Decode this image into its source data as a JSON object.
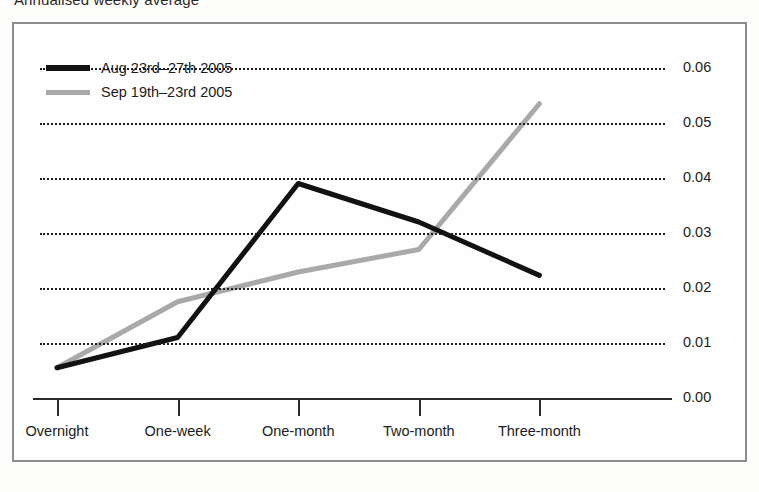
{
  "chart_data": {
    "type": "line",
    "title": "Annualised weekly average",
    "xlabel": "",
    "ylabel": "",
    "categories": [
      "Overnight",
      "One-week",
      "One-month",
      "Two-month",
      "Three-month"
    ],
    "series": [
      {
        "name": "Aug 23rd–27th 2005",
        "color": "#121212",
        "values": [
          0.0055,
          0.011,
          0.039,
          0.032,
          0.0223
        ]
      },
      {
        "name": "Sep 19th–23rd 2005",
        "color": "#a9a9a9",
        "values": [
          0.0055,
          0.0175,
          0.0229,
          0.027,
          0.0535
        ]
      }
    ],
    "ylim": [
      0.0,
      0.06
    ],
    "ytick_labels": [
      "0.00",
      "0.01",
      "0.02",
      "0.03",
      "0.04",
      "0.05",
      "0.06"
    ],
    "ytick_values": [
      0.0,
      0.01,
      0.02,
      0.03,
      0.04,
      0.05,
      0.06
    ],
    "grid": true,
    "grid_style": "dotted",
    "y_axis_side": "right",
    "legend_position": "top-left",
    "frame_color": "#8c8c8c",
    "background_color": "#fefefe"
  },
  "legend": {
    "entries": [
      {
        "label": "Aug 23rd–27th 2005",
        "color": "#121212"
      },
      {
        "label": "Sep 19th–23rd 2005",
        "color": "#a9a9a9"
      }
    ]
  }
}
